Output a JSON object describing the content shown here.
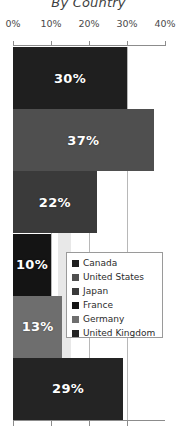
{
  "chart_data": {
    "type": "bar",
    "orientation": "horizontal",
    "title": "By Country",
    "xlabel": "",
    "ylabel": "",
    "xlim": [
      0,
      40
    ],
    "grid": true,
    "legend_position": "center-right-overlay",
    "categories": [
      "Canada",
      "United States",
      "Japan",
      "France",
      "Germany",
      "United Kingdom"
    ],
    "values": [
      30,
      37,
      22,
      10,
      13,
      29
    ],
    "value_labels": [
      "30%",
      "37%",
      "22%",
      "10%",
      "13%",
      "29%"
    ],
    "tick_labels": [
      "0%",
      "10%",
      "20%",
      "30%",
      "40%"
    ],
    "tick_values": [
      0,
      10,
      20,
      30,
      40
    ],
    "colors": [
      "#1f1f1f",
      "#4f4f4f",
      "#3a3a3a",
      "#141414",
      "#6e6e6e",
      "#242424"
    ],
    "series": [
      {
        "name": "Canada",
        "value": 30,
        "label": "30%",
        "color": "#1f1f1f"
      },
      {
        "name": "United States",
        "value": 37,
        "label": "37%",
        "color": "#4f4f4f"
      },
      {
        "name": "Japan",
        "value": 22,
        "label": "22%",
        "color": "#3a3a3a"
      },
      {
        "name": "France",
        "value": 10,
        "label": "10%",
        "color": "#141414"
      },
      {
        "name": "Germany",
        "value": 13,
        "label": "13%",
        "color": "#6e6e6e"
      },
      {
        "name": "United Kingdom",
        "value": 29,
        "label": "29%",
        "color": "#242424"
      }
    ]
  },
  "legend": {
    "items": [
      {
        "label": "Canada",
        "color": "#1f1f1f"
      },
      {
        "label": "United States",
        "color": "#4f4f4f"
      },
      {
        "label": "Japan",
        "color": "#3a3a3a"
      },
      {
        "label": "France",
        "color": "#141414"
      },
      {
        "label": "Germany",
        "color": "#6e6e6e"
      },
      {
        "label": "United Kingdom",
        "color": "#242424"
      }
    ]
  }
}
